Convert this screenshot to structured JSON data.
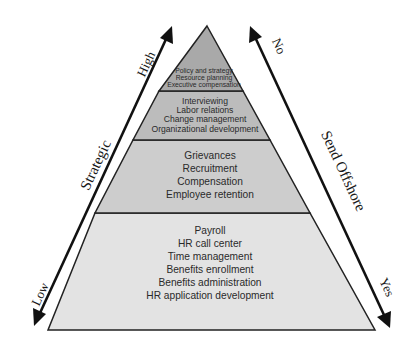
{
  "diagram": {
    "type": "pyramid",
    "layers": [
      {
        "level": 1,
        "position": "top",
        "fill": "#a9a9a9",
        "items": [
          "Policy and strategy",
          "Resource planning",
          "Executive compensation"
        ]
      },
      {
        "level": 2,
        "position": "upper-middle",
        "fill": "#bcbcbc",
        "items": [
          "Interviewing",
          "Labor relations",
          "Change management",
          "Organizational development"
        ]
      },
      {
        "level": 3,
        "position": "lower-middle",
        "fill": "#cdcdcd",
        "items": [
          "Grievances",
          "Recruitment",
          "Compensation",
          "Employee retention"
        ]
      },
      {
        "level": 4,
        "position": "bottom",
        "fill": "#e3e3e3",
        "items": [
          "Payroll",
          "HR call center",
          "Time management",
          "Benefits enrollment",
          "Benefits administration",
          "HR application development"
        ]
      }
    ],
    "left_axis": {
      "label": "Strategic",
      "top_label": "High",
      "bottom_label": "Low",
      "direction": "bidirectional"
    },
    "right_axis": {
      "label": "Send Offshore",
      "top_label": "No",
      "bottom_label": "Yes",
      "direction": "bidirectional"
    }
  }
}
